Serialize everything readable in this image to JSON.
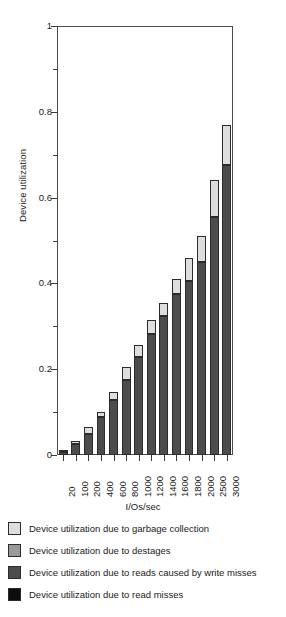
{
  "chart_data": {
    "type": "bar",
    "title": "",
    "subtitle": "",
    "xlabel": "I/Os/sec",
    "ylabel": "Device utilization",
    "ylim": [
      0,
      1
    ],
    "ytick_labels": [
      "0",
      "0.2",
      "0.4",
      "0.6",
      "0.8",
      "1"
    ],
    "ytick_values": [
      0,
      0.2,
      0.4,
      0.6,
      0.8,
      1
    ],
    "yminor_values": [
      0.1,
      0.3,
      0.5,
      0.7,
      0.9
    ],
    "grid": false,
    "stacked": true,
    "legend_position": "below",
    "categories": [
      "20",
      "100",
      "200",
      "400",
      "600",
      "800",
      "1000",
      "1200",
      "1400",
      "1600",
      "1800",
      "2000",
      "2500",
      "3000"
    ],
    "series": [
      {
        "name": "Device utilization due to read misses",
        "color": "#0d0d0d",
        "values": [
          0,
          0,
          0,
          0,
          0,
          0,
          0,
          0,
          0,
          0,
          0,
          0,
          0,
          0
        ]
      },
      {
        "name": "Device utilization due to reads caused by write misses",
        "color": "#4c4c4c",
        "values": [
          0.008,
          0.026,
          0.05,
          0.088,
          0.128,
          0.175,
          0.228,
          0.283,
          0.325,
          0.375,
          0.405,
          0.45,
          0.555,
          0.675
        ]
      },
      {
        "name": "Device utilization due to destages",
        "color": "#9a9a9a",
        "values": [
          0,
          0,
          0,
          0,
          0,
          0,
          0,
          0,
          0,
          0,
          0,
          0,
          0,
          0
        ]
      },
      {
        "name": "Device utilization due to garbage collection",
        "color": "#dedede",
        "values": [
          0.004,
          0.006,
          0.016,
          0.013,
          0.018,
          0.03,
          0.028,
          0.032,
          0.03,
          0.035,
          0.055,
          0.06,
          0.085,
          0.095
        ]
      }
    ],
    "totals": [
      0.012,
      0.032,
      0.066,
      0.101,
      0.146,
      0.205,
      0.256,
      0.315,
      0.355,
      0.41,
      0.46,
      0.51,
      0.64,
      0.77
    ]
  },
  "legend": {
    "items": [
      {
        "label": "Device utilization due to garbage collection",
        "color": "#dedede",
        "swatch_name": "legend-swatch-garbage-collection"
      },
      {
        "label": "Device utilization due to destages",
        "color": "#9a9a9a",
        "swatch_name": "legend-swatch-destages"
      },
      {
        "label": "Device utilization due to reads caused by write misses",
        "color": "#4c4c4c",
        "swatch_name": "legend-swatch-write-miss-reads"
      },
      {
        "label": "Device utilization due to read misses",
        "color": "#0d0d0d",
        "swatch_name": "legend-swatch-read-misses"
      }
    ]
  }
}
